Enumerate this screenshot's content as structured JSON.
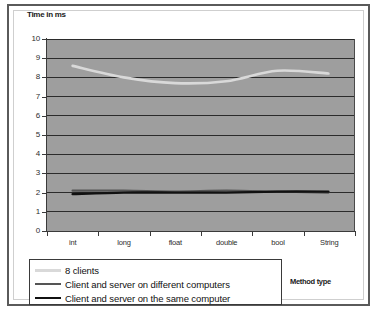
{
  "chart_data": {
    "type": "line",
    "title": "",
    "ylabel": "Time in ms",
    "xlabel": "Method type",
    "categories": [
      "int",
      "long",
      "float",
      "double",
      "bool",
      "String"
    ],
    "ylim": [
      0,
      10
    ],
    "ytick_step": 1,
    "yticks": [
      "10",
      "9",
      "8",
      "7",
      "6",
      "5",
      "4",
      "3",
      "2",
      "1",
      "0"
    ],
    "grid": true,
    "plot_background": "#9e9e9e",
    "legend_position": "below-left",
    "series": [
      {
        "name": "8 clients",
        "color": "#d9d9d9",
        "width": 2.6,
        "values": [
          8.6,
          8.0,
          7.7,
          7.8,
          8.35,
          8.2
        ]
      },
      {
        "name": "Client and server on different computers",
        "color": "#555555",
        "width": 2.2,
        "values": [
          2.1,
          2.1,
          2.05,
          2.1,
          2.05,
          2.0
        ]
      },
      {
        "name": "Client and server on the same computer",
        "color": "#111111",
        "width": 2.4,
        "values": [
          1.92,
          2.0,
          2.0,
          2.0,
          2.05,
          2.05
        ]
      }
    ]
  }
}
